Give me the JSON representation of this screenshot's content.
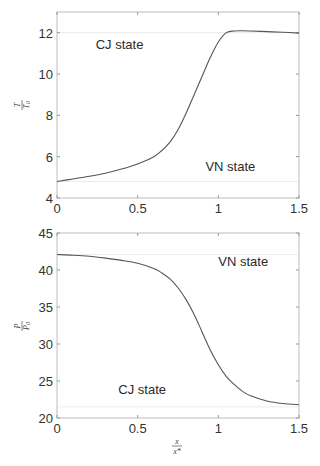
{
  "chart_data": [
    {
      "type": "line",
      "title": "",
      "xlabel": "x/x*",
      "ylabel": "T/T0",
      "ylabel_num": "T",
      "ylabel_den": "T0",
      "xlim": [
        0,
        1.5
      ],
      "ylim": [
        4,
        13
      ],
      "xticks": [
        0,
        0.5,
        1,
        1.5
      ],
      "xtick_labels": [
        "0",
        "0.5",
        "1",
        "1.5"
      ],
      "yticks": [
        4,
        6,
        8,
        10,
        12
      ],
      "ytick_labels": [
        "4",
        "6",
        "8",
        "10",
        "12"
      ],
      "grid": false,
      "series": [
        {
          "name": "T/T0",
          "x": [
            0,
            0.1,
            0.2,
            0.3,
            0.4,
            0.5,
            0.6,
            0.65,
            0.7,
            0.75,
            0.8,
            0.85,
            0.9,
            0.95,
            1.0,
            1.05,
            1.1,
            1.15,
            1.2,
            1.3,
            1.4,
            1.5
          ],
          "y": [
            4.8,
            4.92,
            5.05,
            5.2,
            5.4,
            5.65,
            6.0,
            6.3,
            6.7,
            7.3,
            8.1,
            9.0,
            9.9,
            10.8,
            11.55,
            12.0,
            12.08,
            12.09,
            12.08,
            12.05,
            12.02,
            11.98
          ]
        }
      ],
      "reference_lines": [
        {
          "label": "CJ state",
          "y": 12.0
        },
        {
          "label": "VN state",
          "y": 4.8
        }
      ],
      "annotations": [
        {
          "text": "CJ state",
          "x": 0.24,
          "y": 11.2
        },
        {
          "text": "VN state",
          "x": 0.92,
          "y": 5.3
        }
      ]
    },
    {
      "type": "line",
      "title": "",
      "xlabel": "x/x*",
      "xlabel_num": "x",
      "xlabel_den": "x*",
      "ylabel": "P/P0",
      "ylabel_num": "P",
      "ylabel_den": "P0",
      "xlim": [
        0,
        1.5
      ],
      "ylim": [
        20,
        45
      ],
      "xticks": [
        0,
        0.5,
        1,
        1.5
      ],
      "xtick_labels": [
        "0",
        "0.5",
        "1",
        "1.5"
      ],
      "yticks": [
        20,
        25,
        30,
        35,
        40,
        45
      ],
      "ytick_labels": [
        "20",
        "25",
        "30",
        "35",
        "40",
        "45"
      ],
      "grid": false,
      "series": [
        {
          "name": "P/P0",
          "x": [
            0,
            0.1,
            0.2,
            0.3,
            0.4,
            0.5,
            0.6,
            0.65,
            0.7,
            0.75,
            0.8,
            0.85,
            0.9,
            0.95,
            1.0,
            1.05,
            1.1,
            1.15,
            1.2,
            1.3,
            1.4,
            1.5
          ],
          "y": [
            42.1,
            42.0,
            41.85,
            41.6,
            41.3,
            40.9,
            40.2,
            39.6,
            38.8,
            37.6,
            36.0,
            34.0,
            31.6,
            29.2,
            27.2,
            25.6,
            24.5,
            23.6,
            23.0,
            22.3,
            21.95,
            21.8
          ]
        }
      ],
      "reference_lines": [
        {
          "label": "VN state",
          "y": 42.1
        },
        {
          "label": "CJ state",
          "y": 21.5
        }
      ],
      "annotations": [
        {
          "text": "VN state",
          "x": 1.0,
          "y": 40.5
        },
        {
          "text": "CJ state",
          "x": 0.38,
          "y": 23.2
        }
      ]
    }
  ]
}
